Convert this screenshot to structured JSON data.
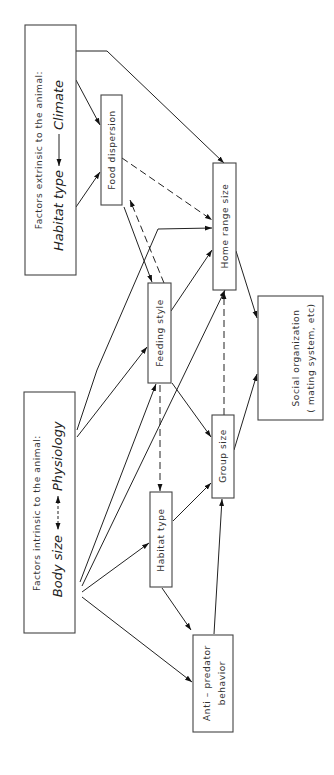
{
  "diagram": {
    "orientation": "rotated-90-ccw",
    "nodes": {
      "extrinsic": {
        "title": "Factors extrinsic to the animal:",
        "left_term": "Habitat type",
        "right_term": "Climate",
        "relation": "Climate → Habitat type"
      },
      "intrinsic": {
        "title": "Factors intrinsic to the animal:",
        "left_term": "Body size",
        "right_term": "Physiology",
        "relation": "Body size ↔ Physiology (dashed)"
      },
      "food_dispersion": {
        "label": "Food dispersion"
      },
      "home_range_size": {
        "label": "Home range size"
      },
      "feeding_style": {
        "label": "Feeding style"
      },
      "group_size": {
        "label": "Group size"
      },
      "habitat_type": {
        "label": "Habitat type"
      },
      "anti_predator": {
        "line1": "Anti – predator",
        "line2": "behavior"
      },
      "social_organization": {
        "line1": "Social organization",
        "line2": "( mating system, etc)"
      }
    },
    "edges": [
      {
        "from": "extrinsic",
        "to": "food_dispersion",
        "style": "solid"
      },
      {
        "from": "extrinsic",
        "to": "home_range_size",
        "style": "solid"
      },
      {
        "from": "food_dispersion",
        "to": "home_range_size",
        "style": "dashed"
      },
      {
        "from": "food_dispersion",
        "to": "feeding_style",
        "style": "solid"
      },
      {
        "from": "feeding_style",
        "to": "food_dispersion",
        "style": "dashed"
      },
      {
        "from": "intrinsic",
        "to": "feeding_style",
        "style": "solid"
      },
      {
        "from": "intrinsic",
        "to": "home_range_size",
        "style": "solid"
      },
      {
        "from": "intrinsic",
        "to": "habitat_type",
        "style": "solid"
      },
      {
        "from": "intrinsic",
        "to": "anti_predator",
        "style": "solid"
      },
      {
        "from": "feeding_style",
        "to": "home_range_size",
        "style": "solid"
      },
      {
        "from": "feeding_style",
        "to": "group_size",
        "style": "solid"
      },
      {
        "from": "feeding_style",
        "to": "habitat_type",
        "style": "dashed"
      },
      {
        "from": "habitat_type",
        "to": "group_size",
        "style": "solid"
      },
      {
        "from": "habitat_type",
        "to": "anti_predator",
        "style": "solid"
      },
      {
        "from": "anti_predator",
        "to": "group_size",
        "style": "solid"
      },
      {
        "from": "group_size",
        "to": "home_range_size",
        "style": "dashed"
      },
      {
        "from": "home_range_size",
        "to": "social_organization",
        "style": "solid"
      },
      {
        "from": "group_size",
        "to": "social_organization",
        "style": "solid"
      }
    ]
  }
}
